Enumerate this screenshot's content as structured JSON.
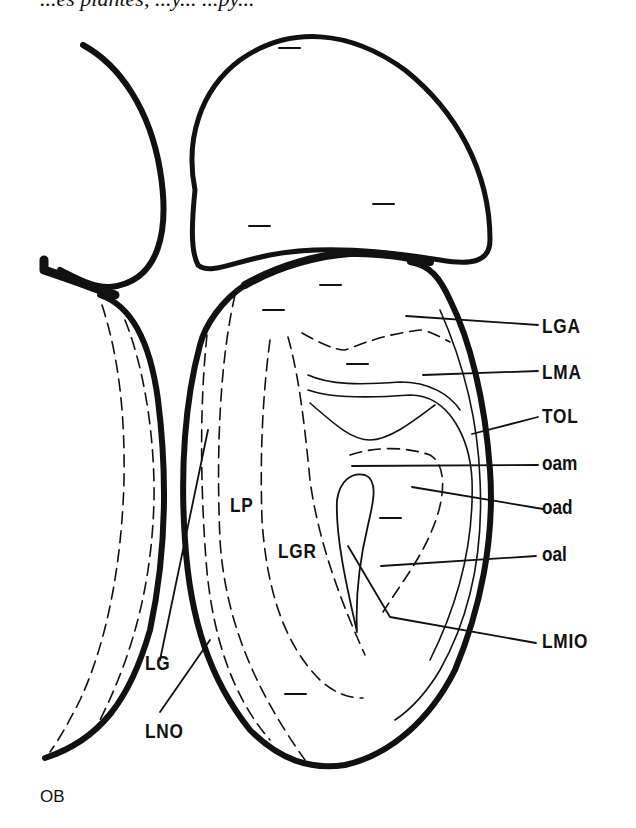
{
  "caption_top": "...es plantes, ...y... ...py...",
  "diagram": {
    "stroke_color": "#111111",
    "background": "#ffffff"
  },
  "labels": {
    "LGA": "LGA",
    "LMA": "LMA",
    "TOL": "TOL",
    "oam": "oam",
    "oad": "oad",
    "oal": "oal",
    "LMIO": "LMIO",
    "LP": "LP",
    "LGR": "LGR",
    "LG": "LG",
    "LNO": "LNO"
  },
  "footer_label": "OB"
}
